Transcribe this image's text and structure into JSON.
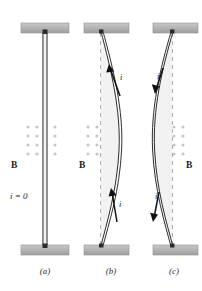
{
  "figure": {
    "background_color": "#ffffff",
    "width": 202,
    "height": 291
  },
  "style": {
    "support_fill": "#b3b3b3",
    "support_stroke": "#8a8a8a",
    "wire_stroke": "#1a1a1a",
    "wire_fill": "#e8e8e8",
    "dashed_stroke": "#9a9a9a",
    "dot_color": "#c8c8c8",
    "arrow_color": "#111111",
    "text_color": "#1a1a1a",
    "caption_color": "#2b2b2b"
  },
  "field": {
    "label": "B",
    "direction": "out-of-page",
    "dot_grid": {
      "columns": 4,
      "rows": 4,
      "spacing_x": 9,
      "spacing_y": 9,
      "dot_radius": 1.6
    }
  },
  "panels": [
    {
      "id": "a",
      "caption": "(a)",
      "caption_x": 45,
      "caption_y": 274,
      "current_label": "i = 0",
      "current_label_x": 10,
      "current_label_y": 199,
      "current_direction": "none",
      "wire_state": "straight",
      "field_label": "B",
      "field_label_x": 11,
      "field_label_y": 168,
      "field_label_side": "left",
      "axis_x": 45,
      "dots_x": 28,
      "dots_y": 127,
      "support_top": {
        "x": 21,
        "y": 23,
        "w": 48,
        "h": 10
      },
      "support_bottom": {
        "x": 21,
        "y": 245,
        "w": 48,
        "h": 10
      },
      "arrows": []
    },
    {
      "id": "b",
      "caption": "(b)",
      "caption_x": 111,
      "caption_y": 274,
      "current_direction": "up",
      "wire_state": "bowed-right",
      "field_label": "B",
      "field_label_x": 79,
      "field_label_y": 168,
      "field_label_side": "left",
      "axis_x": 101,
      "dots_x": 88,
      "dots_y": 127,
      "support_top": {
        "x": 84,
        "y": 23,
        "w": 45,
        "h": 10
      },
      "support_bottom": {
        "x": 84,
        "y": 245,
        "w": 45,
        "h": 10
      },
      "arrows": [
        {
          "label": "i",
          "label_x": 120,
          "label_y": 80,
          "direction": "up"
        },
        {
          "label": "i",
          "label_x": 119,
          "label_y": 207,
          "direction": "up"
        }
      ]
    },
    {
      "id": "c",
      "caption": "(c)",
      "caption_x": 174,
      "caption_y": 274,
      "current_direction": "down",
      "wire_state": "bowed-left",
      "field_label": "B",
      "field_label_x": 186,
      "field_label_y": 168,
      "field_label_side": "right",
      "axis_x": 172,
      "dots_x": 156,
      "dots_y": 127,
      "support_top": {
        "x": 153,
        "y": 23,
        "w": 45,
        "h": 10
      },
      "support_bottom": {
        "x": 153,
        "y": 245,
        "w": 45,
        "h": 10
      },
      "arrows": [
        {
          "label": "i",
          "label_x": 157,
          "label_y": 79,
          "direction": "down"
        },
        {
          "label": "i",
          "label_x": 155,
          "label_y": 199,
          "direction": "down"
        }
      ]
    }
  ]
}
